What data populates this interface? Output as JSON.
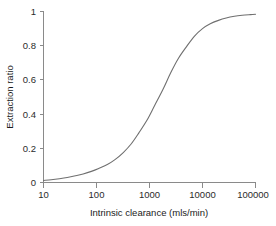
{
  "chart_data": {
    "type": "line",
    "title": "",
    "subtitle": "",
    "xlabel": "Intrinsic clearance (mls/min)",
    "ylabel": "Extraction ratio",
    "xscale": "log",
    "yscale": "linear",
    "xlim": [
      10,
      100000
    ],
    "ylim": [
      0,
      1
    ],
    "xticks": [
      10,
      100,
      1000,
      10000,
      100000
    ],
    "xticklabels": [
      "10",
      "100",
      "1000",
      "10000",
      "100000"
    ],
    "yticks": [
      0,
      0.2,
      0.4,
      0.6,
      0.8,
      1
    ],
    "yticklabels": [
      "0",
      "0.2",
      "0.4",
      "0.6",
      "0.8",
      "1"
    ],
    "grid": false,
    "legend": null,
    "legend_position": "none",
    "annotations": [],
    "series": [
      {
        "name": "Extraction ratio",
        "color": "#6f6f6f",
        "linewidth": 1.1,
        "x": [
          10,
          14,
          20,
          28,
          40,
          56,
          80,
          110,
          160,
          220,
          320,
          450,
          630,
          900,
          1250,
          1800,
          2500,
          3500,
          5000,
          7000,
          10000,
          14000,
          20000,
          28000,
          40000,
          56000,
          80000,
          100000
        ],
        "y": [
          0.012,
          0.016,
          0.022,
          0.029,
          0.039,
          0.05,
          0.065,
          0.082,
          0.105,
          0.132,
          0.175,
          0.225,
          0.29,
          0.365,
          0.45,
          0.545,
          0.64,
          0.725,
          0.795,
          0.855,
          0.9,
          0.928,
          0.948,
          0.962,
          0.972,
          0.978,
          0.982,
          0.984
        ]
      }
    ]
  },
  "axes": {
    "x_title": "Intrinsic clearance (mls/min)",
    "y_title": "Extraction ratio"
  }
}
